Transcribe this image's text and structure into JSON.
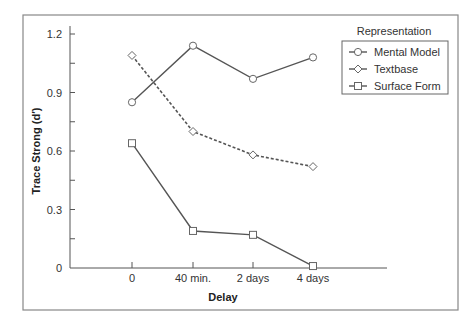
{
  "chart_data": {
    "type": "line",
    "title": "",
    "xlabel": "Delay",
    "ylabel": "Trace Strong (d′)",
    "categories": [
      "0",
      "40 min.",
      "2 days",
      "4 days"
    ],
    "ylim": [
      0,
      1.2
    ],
    "yticks": [
      "0",
      "0.3",
      "0.6",
      "0.9",
      "1.2"
    ],
    "grid": false,
    "legend": {
      "title": "Representation",
      "position": "top-right"
    },
    "series": [
      {
        "name": "Mental Model",
        "marker": "circle",
        "line": "solid",
        "values": [
          0.85,
          1.14,
          0.97,
          1.08
        ]
      },
      {
        "name": "Textbase",
        "marker": "diamond",
        "line": "dashed",
        "values": [
          1.09,
          0.7,
          0.58,
          0.52
        ]
      },
      {
        "name": "Surface Form",
        "marker": "square",
        "line": "solid",
        "values": [
          0.64,
          0.19,
          0.17,
          0.01
        ]
      }
    ]
  },
  "colors": {
    "line": "#555555",
    "marker_stroke": "#666666",
    "frame": "#888888"
  }
}
